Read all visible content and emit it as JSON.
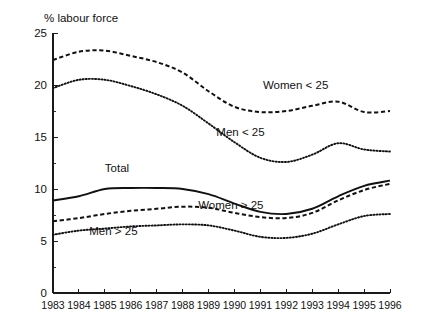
{
  "chart_data": {
    "type": "line",
    "title": "% labour force",
    "xlabel": "",
    "ylabel": "% labour force",
    "x": [
      1983,
      1984,
      1985,
      1986,
      1987,
      1988,
      1989,
      1990,
      1991,
      1992,
      1993,
      1994,
      1995,
      1996
    ],
    "categories": [
      "1983",
      "1984",
      "1985",
      "1986",
      "1987",
      "1988",
      "1989",
      "1990",
      "1991",
      "1992",
      "1993",
      "1994",
      "1995",
      "1996"
    ],
    "xlim": [
      1983,
      1996
    ],
    "ylim": [
      0,
      25
    ],
    "yticks": [
      0,
      5,
      10,
      15,
      20,
      25
    ],
    "ytick_labels": [
      "0",
      "5",
      "10",
      "15",
      "20",
      "25"
    ],
    "grid": false,
    "legend": "inline-annotations",
    "series": [
      {
        "name": "Women < 25",
        "style": "dashed",
        "label_x": 1991.1,
        "label_y": 19.6,
        "values": [
          22.4,
          23.2,
          23.3,
          22.8,
          22.2,
          21.2,
          19.4,
          17.9,
          17.4,
          17.5,
          18.0,
          18.4,
          17.4,
          17.5
        ]
      },
      {
        "name": "Men < 25",
        "style": "dotted",
        "label_x": 1989.3,
        "label_y": 15.1,
        "values": [
          19.7,
          20.5,
          20.5,
          19.9,
          19.1,
          18.0,
          16.3,
          14.5,
          13.0,
          12.6,
          13.3,
          14.4,
          13.8,
          13.6
        ]
      },
      {
        "name": "Total",
        "style": "solid",
        "label_x": 1985.0,
        "label_y": 11.6,
        "values": [
          8.9,
          9.3,
          10.0,
          10.1,
          10.1,
          10.0,
          9.5,
          8.6,
          7.8,
          7.6,
          8.1,
          9.3,
          10.3,
          10.8
        ]
      },
      {
        "name": "Women > 25",
        "style": "dashed",
        "label_x": 1988.6,
        "label_y": 8.1,
        "values": [
          6.9,
          7.2,
          7.6,
          7.9,
          8.1,
          8.3,
          8.2,
          7.7,
          7.3,
          7.2,
          7.7,
          8.9,
          9.9,
          10.5
        ]
      },
      {
        "name": "Men > 25",
        "style": "dotted",
        "label_x": 1984.4,
        "label_y": 5.6,
        "values": [
          5.6,
          6.0,
          6.2,
          6.4,
          6.5,
          6.6,
          6.5,
          6.0,
          5.4,
          5.3,
          5.7,
          6.6,
          7.4,
          7.6
        ]
      }
    ],
    "series_right_end_detail": {
      "Women < 25": [
        22.4,
        23.2,
        23.3,
        22.8,
        22.2,
        21.2,
        19.4,
        17.9,
        17.4,
        17.5,
        18.0,
        18.4,
        17.4,
        17.5
      ]
    }
  }
}
